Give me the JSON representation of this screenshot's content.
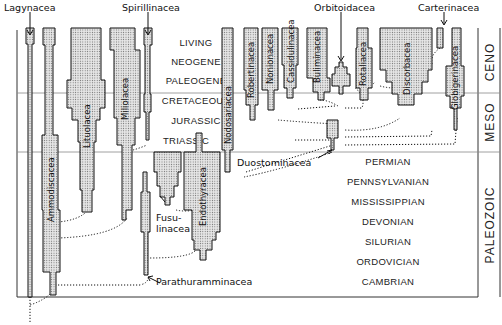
{
  "diagram": {
    "type": "phylogenetic-spindle-diagram"
  },
  "periods": [
    {
      "name": "LIVING",
      "era": "CENO"
    },
    {
      "name": "NEOGENE",
      "era": "CENO"
    },
    {
      "name": "PALEOGENE",
      "era": "CENO"
    },
    {
      "name": "CRETACEOUS",
      "era": "MESO"
    },
    {
      "name": "JURASSIC",
      "era": "MESO"
    },
    {
      "name": "TRIASSIC",
      "era": "MESO"
    },
    {
      "name": "PERMIAN",
      "era": "PALEOZOIC"
    },
    {
      "name": "PENNSYLVANIAN",
      "era": "PALEOZOIC"
    },
    {
      "name": "MISSISSIPPIAN",
      "era": "PALEOZOIC"
    },
    {
      "name": "DEVONIAN",
      "era": "PALEOZOIC"
    },
    {
      "name": "SILURIAN",
      "era": "PALEOZOIC"
    },
    {
      "name": "ORDOVICIAN",
      "era": "PALEOZOIC"
    },
    {
      "name": "CAMBRIAN",
      "era": "PALEOZOIC"
    }
  ],
  "eras": [
    "CENO",
    "MESO",
    "PALEOZOIC"
  ],
  "top_labels": {
    "lagynacea": "Lagynacea",
    "spirillinacea": "Spirillinacea",
    "orbitoidacea": "Orbitoidacea",
    "carterinacea": "Carterinacea"
  },
  "taxa": {
    "ammodiscacea": "Ammodiscacea",
    "lituolacea": "Lituolacea",
    "miliolacea": "Miliolacea",
    "nodosariacea": "Nodosariacea",
    "robertinacea": "Robertinacea",
    "nonionacea": "Nonionacea",
    "cassidulinacea": "Cassidulinacea",
    "buliminacea": "Buliminacea",
    "rotaliacea": "Rotaliacea",
    "discorbacea": "Discorbacea",
    "globigerinacea": "Globigerinacea",
    "endothyracea": "Endothyracea"
  },
  "side_labels": {
    "fusulinacea_1": "Fusu-",
    "fusulinacea_2": "linacea",
    "duostominacea": "Duostominacea",
    "parathuramminacea": "Parathuramminacea"
  }
}
